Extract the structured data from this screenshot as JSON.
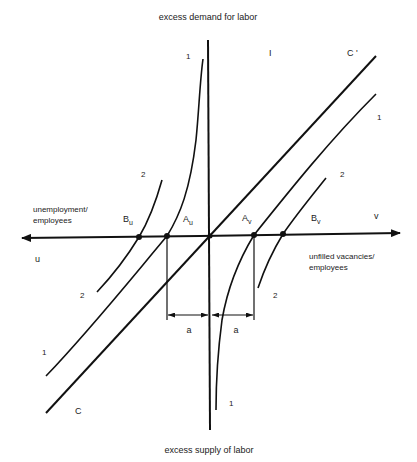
{
  "diagram": {
    "title_top": "excess demand for labor",
    "title_bottom": "excess supply of labor",
    "axis_left": {
      "symbol": "u",
      "label_line1": "unemployment/",
      "label_line2": "employees"
    },
    "axis_right": {
      "symbol": "v",
      "label_line1": "unfilled vacancies/",
      "label_line2": "employees"
    },
    "quadrant_label": "I",
    "line_labels": {
      "c_bottom": "C",
      "c_top": "C '",
      "curve1_top": "1",
      "curve1_right": "1",
      "curve1_left": "1",
      "curve1_bottom": "1",
      "curve2_upper_left": "2",
      "curve2_lower_left": "2",
      "curve2_upper_right": "2",
      "curve2_lower_right": "2"
    },
    "points": {
      "Bu": {
        "main": "B",
        "sub": "u"
      },
      "Au": {
        "main": "A",
        "sub": "u"
      },
      "Av": {
        "main": "A",
        "sub": "v"
      },
      "Bv": {
        "main": "B",
        "sub": "v"
      }
    },
    "distance_label_left": "a",
    "distance_label_right": "a",
    "colors": {
      "line": "#111111",
      "background": "#ffffff"
    }
  }
}
